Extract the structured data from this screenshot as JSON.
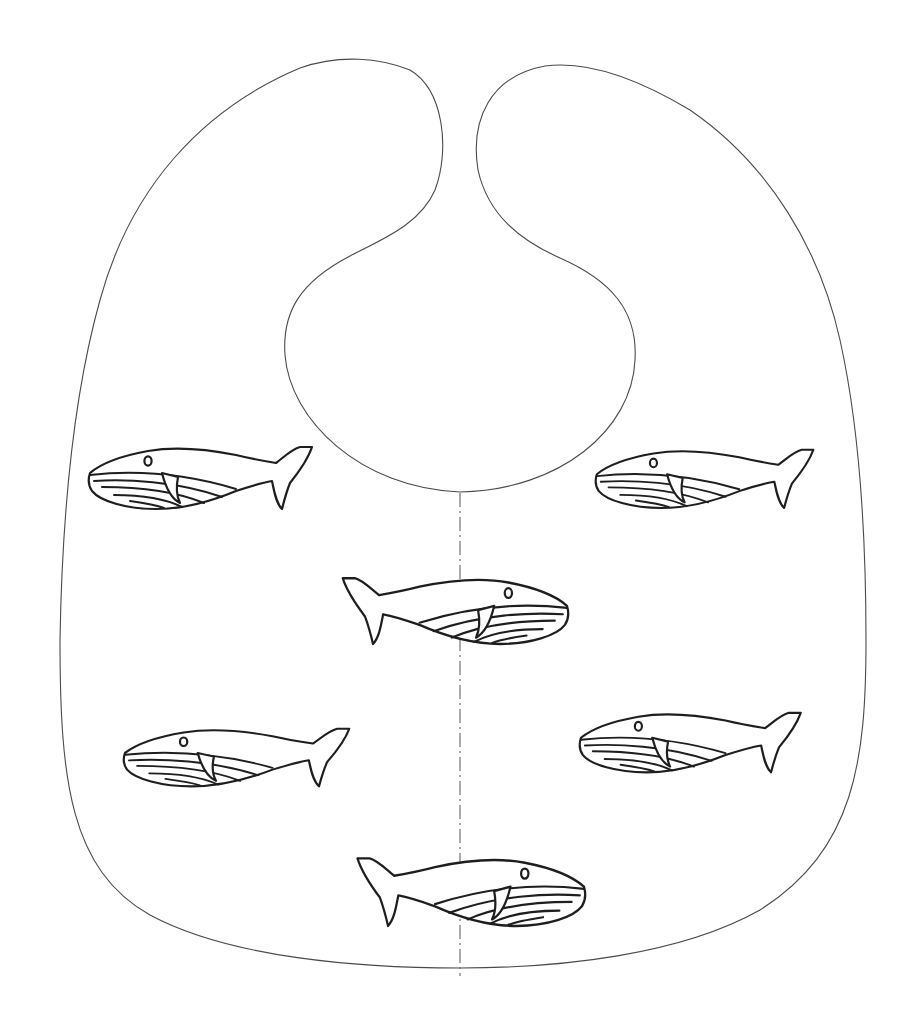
{
  "figure": {
    "title": "Baby bib sewing pattern with whale motif",
    "colors": {
      "background": "#ffffff",
      "outline": "#4a4a4a",
      "motif": "#1e1e1e"
    },
    "bib": {
      "shape": "bib outline with neck opening and two shoulder straps",
      "center_fold_line": "dash-dot vertical line at x=460 from neck opening to below hem"
    },
    "whales": [
      {
        "id": "whale-1",
        "facing": "left",
        "x": 85,
        "y": 442,
        "width": 227,
        "height": 66
      },
      {
        "id": "whale-2",
        "facing": "left",
        "x": 593,
        "y": 446,
        "width": 220,
        "height": 62
      },
      {
        "id": "whale-3",
        "facing": "right",
        "x": 342,
        "y": 574,
        "width": 228,
        "height": 70
      },
      {
        "id": "whale-4",
        "facing": "left",
        "x": 120,
        "y": 725,
        "width": 229,
        "height": 61
      },
      {
        "id": "whale-5",
        "facing": "left",
        "x": 577,
        "y": 709,
        "width": 223,
        "height": 63
      },
      {
        "id": "whale-6",
        "facing": "right",
        "x": 356,
        "y": 854,
        "width": 231,
        "height": 72
      }
    ],
    "whale_count": 6
  }
}
